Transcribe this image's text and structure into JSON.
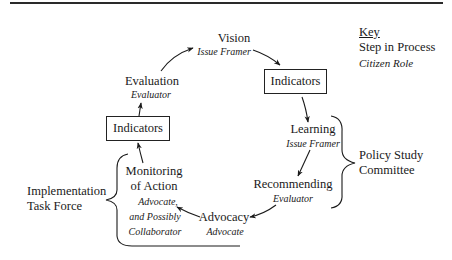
{
  "key": {
    "title": "Key",
    "step_label": "Step in Process",
    "role_label": "Citizen Role"
  },
  "steps": {
    "vision": {
      "step": "Vision",
      "role": "Issue Framer"
    },
    "indicators_right": {
      "label": "Indicators"
    },
    "learning": {
      "step": "Learning",
      "role": "Issue Framer"
    },
    "recommending": {
      "step": "Recommending",
      "role": "Evaluator"
    },
    "advocacy": {
      "step": "Advocacy",
      "role": "Advocate"
    },
    "monitoring": {
      "step_line1": "Monitoring",
      "step_line2": "of Action",
      "role_line1": "Advocate,",
      "role_line2": "and Possibly",
      "role_line3": "Collaborator"
    },
    "indicators_left": {
      "label": "Indicators"
    },
    "evaluation": {
      "step": "Evaluation",
      "role": "Evaluator"
    }
  },
  "groups": {
    "policy_study": {
      "line1": "Policy Study",
      "line2": "Committee"
    },
    "implementation": {
      "line1": "Implementation",
      "line2": "Task Force"
    }
  }
}
